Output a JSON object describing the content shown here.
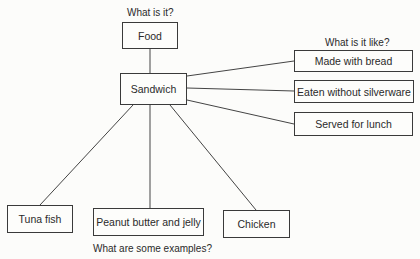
{
  "diagram": {
    "type": "concept map",
    "prompts": {
      "what_is_it": "What is it?",
      "what_is_it_like": "What is it like?",
      "examples": "What are some examples?"
    },
    "nodes": {
      "category": "Food",
      "term": "Sandwich",
      "properties": [
        "Made with bread",
        "Eaten without silverware",
        "Served for lunch"
      ],
      "examples": [
        "Tuna fish",
        "Peanut butter and jelly",
        "Chicken"
      ]
    },
    "edges": [
      [
        "Sandwich",
        "Food"
      ],
      [
        "Sandwich",
        "Made with bread"
      ],
      [
        "Sandwich",
        "Eaten without silverware"
      ],
      [
        "Sandwich",
        "Served for lunch"
      ],
      [
        "Sandwich",
        "Tuna fish"
      ],
      [
        "Sandwich",
        "Peanut butter and jelly"
      ],
      [
        "Sandwich",
        "Chicken"
      ]
    ],
    "colors": {
      "line": "#3a3a3a",
      "background": "#fcfcfa"
    }
  }
}
